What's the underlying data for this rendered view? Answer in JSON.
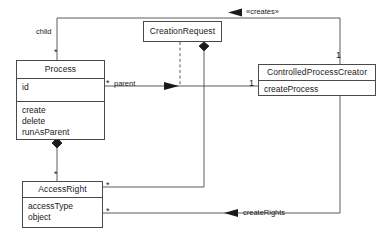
{
  "diagram": {
    "kind": "uml-class-diagram",
    "stroke_color": "#4a4a4a",
    "text_color": "#1a1a1a",
    "background": "#ffffff"
  },
  "classes": {
    "process": {
      "name": "Process",
      "attributes": [
        "id"
      ],
      "operations": [
        "create",
        "delete",
        "runAsParent"
      ]
    },
    "creation_request": {
      "name": "CreationRequest",
      "attributes": [],
      "operations": []
    },
    "controlled_process_creator": {
      "name": "ControlledProcessCreator",
      "attributes": [],
      "operations": [
        "createProcess"
      ]
    },
    "access_right": {
      "name": "AccessRight",
      "attributes": [
        "accessType",
        "object"
      ],
      "operations": []
    }
  },
  "relationships": {
    "child_role": "child",
    "parent_role": "parent",
    "creates_stereotype": "«creates»",
    "create_rights_label": "createRights"
  },
  "multiplicities": {
    "process_child": "*",
    "process_parent": "*",
    "creator_left": "1",
    "creator_top": "1",
    "access_right_top": "*",
    "access_right_assoc_upper": "*",
    "access_right_assoc_lower": "*"
  }
}
